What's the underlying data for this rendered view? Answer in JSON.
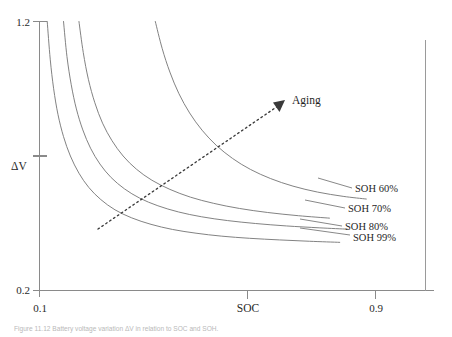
{
  "figure": {
    "caption": "Figure 11.12  Battery voltage variation ΔV in relation to SOC and SOH."
  },
  "chart_data": {
    "type": "line",
    "title": "",
    "xlabel": "SOC",
    "ylabel": "ΔV",
    "xlim": [
      0.1,
      1.0
    ],
    "ylim": [
      0.2,
      1.2
    ],
    "grid": false,
    "legend_position": "right-inline-labels",
    "x_ticks": [
      {
        "value": 0.1,
        "label": "0.1"
      },
      {
        "value": 0.55,
        "label": ""
      },
      {
        "value": 0.9,
        "label": "0.9"
      }
    ],
    "y_ticks": [
      {
        "value": 1.2,
        "label": "1.2"
      },
      {
        "value": 0.7,
        "label": ""
      },
      {
        "value": 0.2,
        "label": "0.2"
      }
    ],
    "series": [
      {
        "name": "SOH 99%",
        "label": "SOH 99%",
        "points": [
          [
            0.118,
            1.2
          ],
          [
            0.125,
            1.06
          ],
          [
            0.133,
            0.95
          ],
          [
            0.143,
            0.855
          ],
          [
            0.156,
            0.772
          ],
          [
            0.172,
            0.7
          ],
          [
            0.192,
            0.636
          ],
          [
            0.215,
            0.583
          ],
          [
            0.243,
            0.538
          ],
          [
            0.276,
            0.5
          ],
          [
            0.315,
            0.47
          ],
          [
            0.36,
            0.446
          ],
          [
            0.41,
            0.427
          ],
          [
            0.465,
            0.413
          ],
          [
            0.525,
            0.402
          ],
          [
            0.59,
            0.394
          ],
          [
            0.66,
            0.388
          ],
          [
            0.73,
            0.383
          ],
          [
            0.8,
            0.379
          ]
        ]
      },
      {
        "name": "SOH 80%",
        "label": "SOH 80%",
        "points": [
          [
            0.156,
            1.2
          ],
          [
            0.164,
            1.07
          ],
          [
            0.174,
            0.965
          ],
          [
            0.186,
            0.875
          ],
          [
            0.201,
            0.797
          ],
          [
            0.219,
            0.729
          ],
          [
            0.241,
            0.67
          ],
          [
            0.267,
            0.62
          ],
          [
            0.298,
            0.578
          ],
          [
            0.334,
            0.543
          ],
          [
            0.376,
            0.515
          ],
          [
            0.424,
            0.492
          ],
          [
            0.478,
            0.474
          ],
          [
            0.538,
            0.46
          ],
          [
            0.604,
            0.449
          ],
          [
            0.676,
            0.44
          ],
          [
            0.752,
            0.433
          ],
          [
            0.818,
            0.428
          ]
        ]
      },
      {
        "name": "SOH 70%",
        "label": "SOH 70%",
        "points": [
          [
            0.192,
            1.2
          ],
          [
            0.202,
            1.085
          ],
          [
            0.214,
            0.985
          ],
          [
            0.229,
            0.898
          ],
          [
            0.247,
            0.822
          ],
          [
            0.269,
            0.757
          ],
          [
            0.295,
            0.7
          ],
          [
            0.326,
            0.651
          ],
          [
            0.362,
            0.61
          ],
          [
            0.404,
            0.576
          ],
          [
            0.452,
            0.547
          ],
          [
            0.506,
            0.524
          ],
          [
            0.566,
            0.505
          ],
          [
            0.632,
            0.49
          ],
          [
            0.704,
            0.478
          ],
          [
            0.776,
            0.469
          ]
        ]
      },
      {
        "name": "SOH 60%",
        "label": "SOH 60%",
        "points": [
          [
            0.37,
            1.2
          ],
          [
            0.386,
            1.1
          ],
          [
            0.404,
            1.012
          ],
          [
            0.425,
            0.932
          ],
          [
            0.45,
            0.86
          ],
          [
            0.479,
            0.796
          ],
          [
            0.512,
            0.74
          ],
          [
            0.55,
            0.691
          ],
          [
            0.592,
            0.65
          ],
          [
            0.639,
            0.616
          ],
          [
            0.691,
            0.588
          ],
          [
            0.748,
            0.566
          ],
          [
            0.808,
            0.55
          ],
          [
            0.862,
            0.54
          ]
        ]
      }
    ],
    "annotations": [
      {
        "name": "aging-arrow",
        "text": "Aging",
        "style": "dashed-arrow",
        "from": [
          0.23,
          0.495
        ],
        "to": [
          0.665,
          0.88
        ]
      }
    ]
  }
}
